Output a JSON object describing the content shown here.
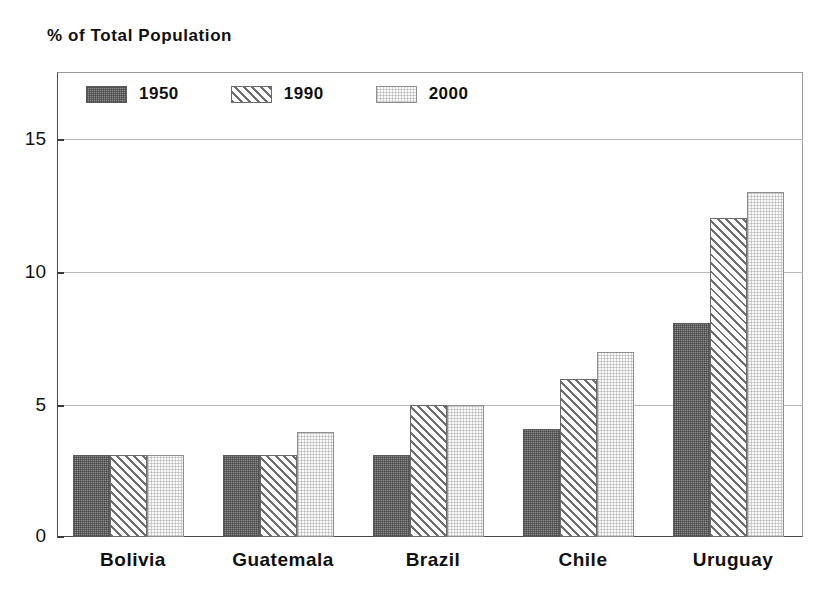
{
  "chart_data": {
    "type": "bar",
    "title": "% of Total Population",
    "xlabel": "",
    "ylabel": "% of Total Population",
    "categories": [
      "Bolivia",
      "Guatemala",
      "Brazil",
      "Chile",
      "Uruguay"
    ],
    "series": [
      {
        "name": "1950",
        "values": [
          3.1,
          3.1,
          3.1,
          4.1,
          8.1
        ],
        "fill": "dark-stipple",
        "color": "#8c8c8c"
      },
      {
        "name": "1990",
        "values": [
          3.1,
          3.1,
          5.0,
          6.0,
          12.1
        ],
        "fill": "diagonal-hatch",
        "color": "#6f6f6f"
      },
      {
        "name": "2000",
        "values": [
          3.1,
          4.0,
          5.0,
          7.0,
          13.1
        ],
        "fill": "light-stipple",
        "color": "#fafafa"
      }
    ],
    "ylim": [
      0,
      17.6
    ],
    "yticks": [
      0,
      5,
      10,
      15
    ],
    "ytick_labels": [
      "0",
      "5",
      "10",
      "15"
    ],
    "grid": true,
    "grid_axis": "y",
    "legend_position": "top-left-inside",
    "legend_entries": [
      "1950",
      "1990",
      "2000"
    ]
  },
  "axis": {
    "title": "% of Total Population",
    "ytick_labels": [
      "15",
      "10",
      "5",
      "0"
    ]
  },
  "legend": {
    "items": [
      {
        "label": "1950",
        "swatch": "dark-stipple-swatch"
      },
      {
        "label": "1990",
        "swatch": "diagonal-hatch-swatch"
      },
      {
        "label": "2000",
        "swatch": "light-stipple-swatch"
      }
    ]
  },
  "xaxis": {
    "labels": [
      "Bolivia",
      "Guatemala",
      "Brazil",
      "Chile",
      "Uruguay"
    ]
  }
}
